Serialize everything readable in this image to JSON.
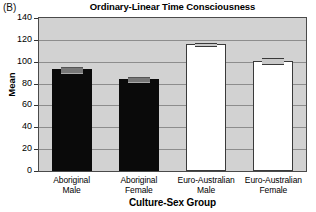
{
  "panel": {
    "label": "(B)"
  },
  "chart_data": {
    "type": "bar",
    "title": "Ordinary-Linear Time Consciousness",
    "xlabel": "Culture-Sex Group",
    "ylabel": "Mean",
    "ylim": [
      0,
      140
    ],
    "yticks": [
      0,
      20,
      40,
      60,
      80,
      100,
      120,
      140
    ],
    "ytick_labels": [
      "0",
      "20",
      "40",
      "60",
      "80",
      "100",
      "120",
      "140"
    ],
    "grid": true,
    "legend": "none",
    "categories": [
      "Aboriginal Male",
      "Aboriginal Female",
      "Euro-Australian Male",
      "Euro-Australian Female"
    ],
    "category_lines": [
      [
        "Aboriginal",
        "Male"
      ],
      [
        "Aboriginal",
        "Female"
      ],
      [
        "Euro-Australian",
        "Male"
      ],
      [
        "Euro-Australian",
        "Female"
      ]
    ],
    "values": [
      93,
      84,
      116,
      101
    ],
    "errors": [
      3,
      3,
      2,
      3
    ],
    "bar_fill": [
      "#0a0a0a",
      "#0a0a0a",
      "#ffffff",
      "#ffffff"
    ],
    "bar_styles": [
      "dark",
      "dark",
      "light",
      "light"
    ],
    "colors": {
      "plot_background": "#d2d2d2",
      "gridline": "#8d8d8d",
      "frame": "#4a4a4a",
      "dark_bar": "#0a0a0a",
      "light_bar": "#ffffff",
      "page_background": "#ffffff",
      "text": "#000000"
    }
  }
}
